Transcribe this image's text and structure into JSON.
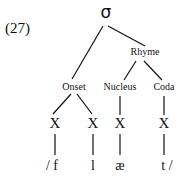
{
  "example_number": "(27)",
  "root": "σ",
  "rhyme": "Rhyme",
  "constituents": [
    {
      "label": "Onset",
      "x": 74
    },
    {
      "label": "Nucleus",
      "x": 120
    },
    {
      "label": "Coda",
      "x": 163
    }
  ],
  "timing_slots": [
    {
      "label": "X",
      "x": 55
    },
    {
      "label": "X",
      "x": 92
    },
    {
      "label": "X",
      "x": 120
    },
    {
      "label": "X",
      "x": 164
    }
  ],
  "segments": [
    {
      "label": "/ f",
      "x": 52
    },
    {
      "label": "l",
      "x": 93
    },
    {
      "label": "æ",
      "x": 120
    },
    {
      "label": "t /",
      "x": 166
    }
  ]
}
